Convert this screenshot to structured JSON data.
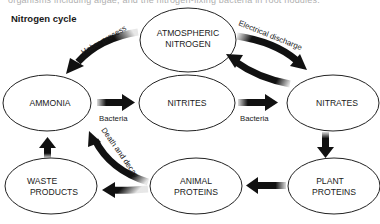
{
  "header": {
    "clipped_text": "organisms including algae, and the nitrogen-fixing bacteria in root nodules.",
    "title": "Nitrogen cycle"
  },
  "nodes": {
    "atmospheric": [
      "ATMOSPHERIC",
      "NITROGEN"
    ],
    "ammonia": [
      "AMMONIA"
    ],
    "nitrites": [
      "NITRITES"
    ],
    "nitrates": [
      "NITRATES"
    ],
    "waste": [
      "WASTE",
      "PRODUCTS"
    ],
    "animal": [
      "ANIMAL",
      "PROTEINS"
    ],
    "plant": [
      "PLANT",
      "PROTEINS"
    ]
  },
  "edges": {
    "haber": "Haber process",
    "electrical": "Electrical discharge",
    "bacteria_1": "Bacteria",
    "bacteria_2": "Bacteria",
    "death": "Death and decay"
  },
  "colors": {
    "ink": "#111111",
    "outline": "#222222",
    "background": "#ffffff"
  }
}
